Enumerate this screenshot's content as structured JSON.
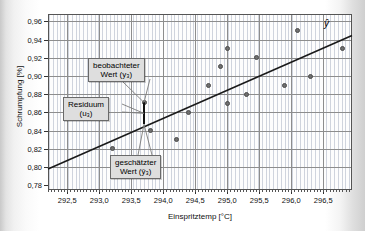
{
  "chart_data": {
    "type": "scatter",
    "title": "",
    "xlabel": "Einspritztemp [°C]",
    "ylabel": "Schrumpfung [%]",
    "xlim": [
      292.2,
      296.95
    ],
    "ylim": [
      0.775,
      0.968
    ],
    "xticks": [
      "292,5",
      "293,0",
      "293,5",
      "294,0",
      "294,5",
      "295,0",
      "295,5",
      "296,0",
      "296,5"
    ],
    "xtick_values": [
      292.5,
      293.0,
      293.5,
      294.0,
      294.5,
      295.0,
      295.5,
      296.0,
      296.5
    ],
    "yticks": [
      "0,78",
      "0,80",
      "0,82",
      "0,84",
      "0,86",
      "0,88",
      "0,90",
      "0,92",
      "0,94",
      "0,96"
    ],
    "ytick_values": [
      0.78,
      0.8,
      0.82,
      0.84,
      0.86,
      0.88,
      0.9,
      0.92,
      0.94,
      0.96
    ],
    "grid": true,
    "legend": "none",
    "points": [
      {
        "x": 293.2,
        "y": 0.82
      },
      {
        "x": 293.7,
        "y": 0.871
      },
      {
        "x": 293.8,
        "y": 0.84
      },
      {
        "x": 294.2,
        "y": 0.83
      },
      {
        "x": 294.4,
        "y": 0.86
      },
      {
        "x": 294.7,
        "y": 0.89
      },
      {
        "x": 294.9,
        "y": 0.91
      },
      {
        "x": 295.0,
        "y": 0.93
      },
      {
        "x": 295.0,
        "y": 0.87
      },
      {
        "x": 295.3,
        "y": 0.88
      },
      {
        "x": 295.45,
        "y": 0.92
      },
      {
        "x": 295.9,
        "y": 0.89
      },
      {
        "x": 296.1,
        "y": 0.95
      },
      {
        "x": 296.3,
        "y": 0.9
      },
      {
        "x": 296.8,
        "y": 0.93
      }
    ],
    "series": [
      {
        "name": "ŷ",
        "type": "line",
        "label": "ŷ",
        "x": [
          292.2,
          296.95
        ],
        "y": [
          0.798,
          0.9445
        ]
      }
    ],
    "residual": {
      "x": 293.7,
      "observed": 0.871,
      "fitted": 0.847
    },
    "annotations": [
      {
        "id": "observed",
        "line1": "beobachteter",
        "line2": "Wert (y₃)"
      },
      {
        "id": "residual",
        "line1": "Residuum",
        "line2": "(u₃)"
      },
      {
        "id": "fitted",
        "line1": "geschätzter",
        "line2": "Wert (ŷ₃)"
      }
    ]
  },
  "axes": {
    "x_title": "Einspritztemp [°C]",
    "y_title": "Schrumpfung [%]"
  },
  "labels": {
    "regression_line": "ŷ",
    "observed_l1": "beobachteter",
    "observed_l2": "Wert (y₃)",
    "residual_l1": "Residuum",
    "residual_l2": "(u₃)",
    "fitted_l1": "geschätzter",
    "fitted_l2": "Wert (ŷ₃)"
  },
  "colors": {
    "point": "#6f6f6f",
    "line": "#1a1a1a",
    "grid": "#8d8d8d",
    "frame": "#555555",
    "callout_bg": "#dedede"
  }
}
